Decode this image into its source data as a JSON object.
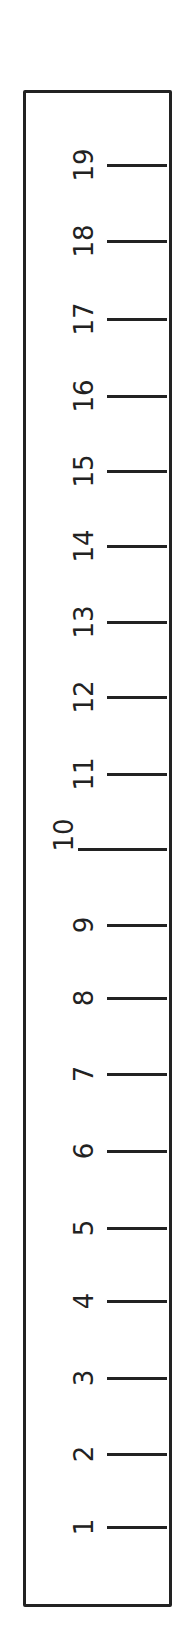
{
  "ruler": {
    "orientation": "vertical",
    "line_color": "#222222",
    "background": "#ffffff",
    "ticks": [
      {
        "label": "19",
        "y": 165,
        "major": false
      },
      {
        "label": "18",
        "y": 241,
        "major": false
      },
      {
        "label": "17",
        "y": 319,
        "major": false
      },
      {
        "label": "16",
        "y": 396,
        "major": false
      },
      {
        "label": "15",
        "y": 471,
        "major": false
      },
      {
        "label": "14",
        "y": 546,
        "major": false
      },
      {
        "label": "13",
        "y": 622,
        "major": false
      },
      {
        "label": "12",
        "y": 697,
        "major": false
      },
      {
        "label": "11",
        "y": 774,
        "major": false
      },
      {
        "label": "10",
        "y": 849,
        "major": true
      },
      {
        "label": "9",
        "y": 925,
        "major": false
      },
      {
        "label": "8",
        "y": 998,
        "major": false
      },
      {
        "label": "7",
        "y": 1074,
        "major": false
      },
      {
        "label": "6",
        "y": 1151,
        "major": false
      },
      {
        "label": "5",
        "y": 1228,
        "major": false
      },
      {
        "label": "4",
        "y": 1301,
        "major": false
      },
      {
        "label": "3",
        "y": 1378,
        "major": false
      },
      {
        "label": "2",
        "y": 1454,
        "major": false
      },
      {
        "label": "1",
        "y": 1527,
        "major": false
      }
    ]
  }
}
